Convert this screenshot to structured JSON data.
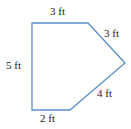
{
  "figure": {
    "type": "pentagon",
    "stroke_color": "#5b8fc7",
    "vertices": [
      [
        32,
        23
      ],
      [
        88,
        23
      ],
      [
        125,
        63
      ],
      [
        70,
        110
      ],
      [
        32,
        110
      ]
    ],
    "labels": {
      "top": "3 ft",
      "upper_right": "3 ft",
      "left": "5 ft",
      "lower_right": "4 ft",
      "bottom": "2 ft"
    }
  }
}
